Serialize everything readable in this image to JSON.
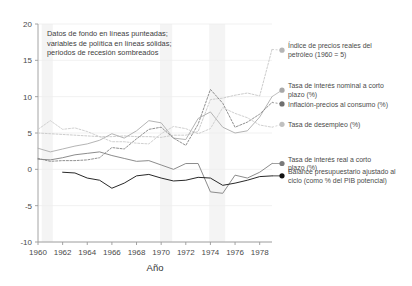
{
  "chart_data": {
    "type": "line",
    "title": "",
    "xlabel": "Año",
    "ylabel": "",
    "xlim": [
      1960,
      1979
    ],
    "ylim": [
      -10,
      20
    ],
    "grid": true,
    "legend_position": "right-inline",
    "xticks": [
      "1960",
      "1962",
      "1964",
      "1966",
      "1968",
      "1970",
      "1972",
      "1974",
      "1976",
      "1978"
    ],
    "xtick_values": [
      1960,
      1962,
      1964,
      1966,
      1968,
      1970,
      1972,
      1974,
      1976,
      1978
    ],
    "yticks": [
      "-10",
      "-5",
      "0",
      "5",
      "10",
      "15",
      "20"
    ],
    "ytick_values": [
      -10,
      -5,
      0,
      5,
      10,
      15,
      20
    ],
    "annotation": "Datos de fondo en líneas punteadas; variables de política en líneas sólidas; periodos de recesión sombreados",
    "annotation_lines": [
      "Datos de fondo en líneas punteadas;",
      "variables de política en líneas sólidas;",
      "periodos de recesión sombreados"
    ],
    "x": [
      1960,
      1961,
      1962,
      1963,
      1964,
      1965,
      1966,
      1967,
      1968,
      1969,
      1970,
      1971,
      1972,
      1973,
      1974,
      1975,
      1976,
      1977,
      1978,
      1979
    ],
    "recessions": [
      {
        "start": 1960.3,
        "end": 1961.2
      },
      {
        "start": 1969.9,
        "end": 1970.9
      },
      {
        "start": 1973.9,
        "end": 1975.2
      }
    ],
    "series": [
      {
        "name": "Índice de precios reales del petróleo (1960 = 5)",
        "style": "dotted",
        "color": "#c9c9c9",
        "marker_color": "#b5b5b5",
        "label_y": 16.4,
        "values": [
          5.0,
          4.9,
          4.8,
          4.7,
          4.6,
          4.5,
          4.5,
          4.6,
          4.5,
          4.5,
          4.4,
          4.7,
          4.7,
          5.2,
          9.6,
          9.8,
          10.2,
          10.5,
          10.1,
          16.5
        ]
      },
      {
        "name": "Tasa de interés nominal a corto plazo (%)",
        "style": "solid",
        "color": "#b0b0b0",
        "marker_color": "#a8a8a8",
        "label_y": 10.9,
        "values": [
          2.9,
          2.4,
          2.8,
          3.2,
          3.5,
          4.0,
          4.9,
          4.3,
          5.3,
          6.7,
          6.4,
          4.3,
          4.1,
          7.0,
          7.9,
          5.8,
          5.0,
          5.3,
          7.2,
          10.0
        ]
      },
      {
        "name": "Inflación-precios al consumo (%)",
        "style": "dotted",
        "color": "#8a8a8a",
        "marker_color": "#6f6f6f",
        "label_y": 9.0,
        "values": [
          1.5,
          1.1,
          1.2,
          1.2,
          1.3,
          1.6,
          3.0,
          2.8,
          4.2,
          5.5,
          5.8,
          4.3,
          3.3,
          6.2,
          11.0,
          9.1,
          5.8,
          6.5,
          7.6,
          9.2
        ]
      },
      {
        "name": "Tasa de desempleo (%)",
        "style": "dotted",
        "color": "#cdcdcd",
        "marker_color": "#c0c0c0",
        "label_y": 6.2,
        "values": [
          5.5,
          6.7,
          5.5,
          5.7,
          5.2,
          4.5,
          3.8,
          3.8,
          3.6,
          3.5,
          4.9,
          5.9,
          5.6,
          4.9,
          5.6,
          8.5,
          7.7,
          7.1,
          6.1,
          5.8
        ]
      },
      {
        "name": "Tasa de interés real a corto plazo (%)",
        "style": "solid",
        "color": "#868686",
        "marker_color": "#7a7a7a",
        "label_y": 0.8,
        "values": [
          1.4,
          1.3,
          1.6,
          2.0,
          2.2,
          2.4,
          1.9,
          1.5,
          1.1,
          1.2,
          0.6,
          0.0,
          0.8,
          0.8,
          -3.1,
          -3.3,
          -0.8,
          -1.2,
          -0.4,
          0.8
        ]
      },
      {
        "name": "Balance presupuestario ajustado al ciclo (como % del PIB potencial)",
        "style": "solid",
        "color": "#1e1e1e",
        "marker_color": "#111111",
        "label_y": -0.9,
        "values": [
          null,
          null,
          -0.4,
          -0.5,
          -1.2,
          -1.5,
          -2.6,
          -1.9,
          -0.9,
          -0.7,
          -1.2,
          -1.6,
          -1.5,
          -1.1,
          -1.2,
          -2.2,
          -1.9,
          -1.5,
          -1.0,
          -0.9
        ]
      }
    ]
  },
  "legend": {
    "items": [
      {
        "label_lines": [
          "Índice de precios reales del",
          "petróleo (1960 = 5)"
        ],
        "marker": "dot-light"
      },
      {
        "label_lines": [
          "Tasa de interés nominal a corto",
          "plazo (%)"
        ],
        "marker": "dot-light"
      },
      {
        "label_lines": [
          "Inflación-precios al consumo (%)"
        ],
        "marker": "dot-dark"
      },
      {
        "label_lines": [
          "Tasa de desempleo (%)"
        ],
        "marker": "dot-light"
      },
      {
        "label_lines": [
          "Tasa de interés real a corto",
          "plazo (%)"
        ],
        "marker": "dot-mid"
      },
      {
        "label_lines": [
          "Balance presupuestario ajustado al",
          "ciclo (como % del PIB potencial)"
        ],
        "marker": "dot-black"
      }
    ]
  },
  "colors": {
    "background": "#ffffff",
    "axis": "#9a9a9a",
    "grid": "#ededed",
    "recession_band": "#f4f4f4",
    "text": "#3b3b3b"
  }
}
